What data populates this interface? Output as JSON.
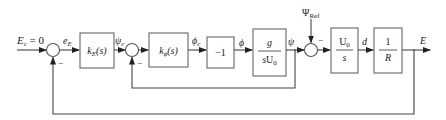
{
  "diagram": {
    "type": "control-system-block-diagram",
    "input": {
      "label_var": "E",
      "label_sub": "c",
      "label_rest": " = 0"
    },
    "signals": {
      "e_E": {
        "main": "e",
        "sub": "E"
      },
      "psi_c": {
        "main": "ψ",
        "sub": "c"
      },
      "phi_c": {
        "main": "ϕ",
        "sub": "c"
      },
      "phi": {
        "main": "ϕ"
      },
      "psi": {
        "main": "ψ"
      },
      "psi_ref": {
        "main": "Ψ",
        "sub": "Ref"
      },
      "d": {
        "main": "d"
      },
      "E": {
        "main": "E"
      }
    },
    "blocks": {
      "k_E": {
        "main": "k",
        "sub": "E",
        "arg": "(s)"
      },
      "k_phi": {
        "main": "k",
        "sub": "ϕ",
        "arg": "(s)"
      },
      "neg_one": {
        "label": "−1"
      },
      "g_over_sU0": {
        "num": "g",
        "den_s": "s",
        "den_U": "U",
        "den_sub": "0"
      },
      "U0_over_s": {
        "num_U": "U",
        "num_sub": "0",
        "den": "s"
      },
      "one_over_R": {
        "num": "1",
        "den": "R"
      }
    },
    "junctions": {
      "sum1": {
        "minus_label": "−"
      },
      "sum2": {
        "minus_label": "−"
      },
      "sum3": {
        "minus_label": "−"
      }
    }
  }
}
